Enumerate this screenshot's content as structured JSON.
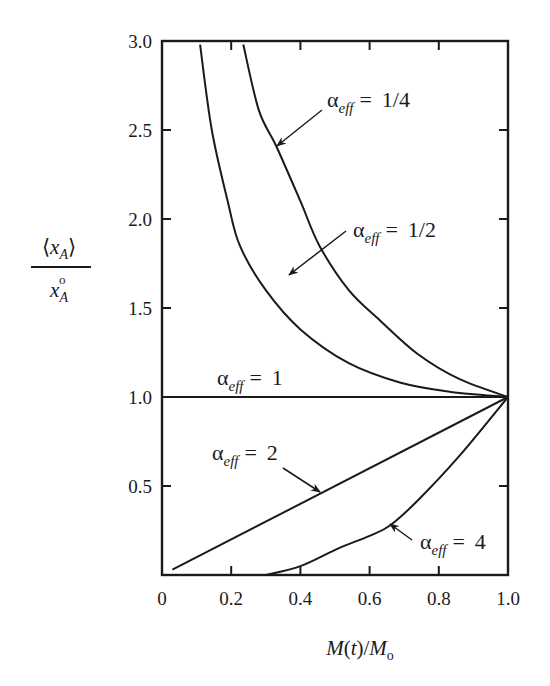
{
  "chart_data": {
    "type": "line",
    "title": "",
    "xlabel": "M(t)/M₀",
    "ylabel": "⟨x_A⟩ / x_A°",
    "xlim": [
      0,
      1.0
    ],
    "ylim": [
      0,
      3.0
    ],
    "grid": false,
    "legend": "inline annotations with arrows",
    "x_ticks": [
      0,
      0.2,
      0.4,
      0.6,
      0.8,
      1.0
    ],
    "x_tick_labels": [
      "0",
      "0.2",
      "0.4",
      "0.6",
      "0.8",
      "1.0"
    ],
    "y_ticks": [
      0.5,
      1.0,
      1.5,
      2.0,
      2.5,
      3.0
    ],
    "y_tick_labels": [
      "0.5",
      "1.0",
      "1.5",
      "2.0",
      "2.5",
      "3.0"
    ],
    "series": [
      {
        "name": "α_eff = 1/4",
        "label_main": "α",
        "label_sub": "eff",
        "label_value": "= 1/4",
        "x": [
          0.235,
          0.28,
          0.33,
          0.4,
          0.455,
          0.54,
          0.63,
          0.74,
          0.86,
          1.0
        ],
        "y": [
          2.98,
          2.61,
          2.41,
          2.1,
          1.85,
          1.6,
          1.43,
          1.24,
          1.1,
          1.0
        ],
        "label_pos": [
          327,
          107
        ],
        "arrow": [
          [
            322,
            110
          ],
          [
            277,
            146
          ]
        ]
      },
      {
        "name": "α_eff = 1/2",
        "label_main": "α",
        "label_sub": "eff",
        "label_value": "= 1/2",
        "x": [
          0.11,
          0.144,
          0.19,
          0.225,
          0.3,
          0.4,
          0.54,
          0.69,
          0.83,
          1.0
        ],
        "y": [
          2.98,
          2.5,
          2.1,
          1.85,
          1.6,
          1.38,
          1.19,
          1.08,
          1.03,
          1.0
        ],
        "label_pos": [
          353,
          237
        ],
        "arrow": [
          [
            346,
            231
          ],
          [
            289,
            275
          ]
        ]
      },
      {
        "name": "α_eff = 1",
        "label_main": "α",
        "label_sub": "eff",
        "label_value": "= 1",
        "x": [
          0.0,
          1.0
        ],
        "y": [
          1.0,
          1.0
        ],
        "label_pos": [
          217,
          385
        ],
        "arrow": null
      },
      {
        "name": "α_eff = 2",
        "label_main": "α",
        "label_sub": "eff",
        "label_value": "= 2",
        "x": [
          0.03,
          1.0
        ],
        "y": [
          0.03,
          1.0
        ],
        "label_pos": [
          212,
          460
        ],
        "arrow": [
          [
            283,
            468
          ],
          [
            320,
            492
          ]
        ]
      },
      {
        "name": "α_eff = 4",
        "label_main": "α",
        "label_sub": "eff",
        "label_value": "= 4",
        "x": [
          0.3,
          0.4,
          0.51,
          0.6,
          0.66,
          0.74,
          0.86,
          1.0
        ],
        "y": [
          0.0,
          0.05,
          0.15,
          0.22,
          0.28,
          0.42,
          0.67,
          1.0
        ],
        "label_pos": [
          420,
          549
        ],
        "arrow": [
          [
            412,
            540
          ],
          [
            390,
            524
          ]
        ]
      }
    ]
  },
  "labels": {
    "x_axis": "M(t)/M₀",
    "y_axis_numerator": "⟨x_A⟩",
    "y_axis_denominator": "x_A°"
  }
}
